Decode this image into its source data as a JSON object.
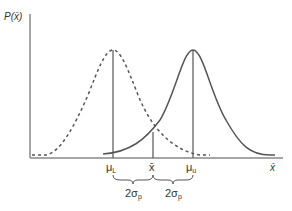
{
  "diagram": {
    "y_axis_label": "P(x̄)",
    "x_axis_label": "x̄",
    "markers": {
      "mu_L": "μ",
      "mu_L_sub": "L",
      "x_bar": "x̄",
      "mu_u": "μ",
      "mu_u_sub": "u"
    },
    "spans": {
      "left_main": "2σ",
      "left_sub": "p",
      "right_main": "2σ",
      "right_sub": "p"
    },
    "curves": [
      {
        "name": "lower-distribution",
        "style": "dashed",
        "center": "μL"
      },
      {
        "name": "upper-distribution",
        "style": "solid",
        "center": "μu"
      }
    ],
    "colors": {
      "axis": "#888888",
      "curve": "#555555",
      "text": "#333333"
    }
  }
}
